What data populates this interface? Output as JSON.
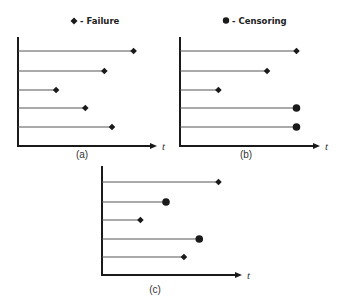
{
  "legend": {
    "failure": {
      "symbol": "diamond",
      "label": "- Failure"
    },
    "censoring": {
      "symbol": "circle",
      "label": "- Censoring"
    }
  },
  "axis_label": "t",
  "colors": {
    "ink": "#1a1a1a",
    "line": "#555555"
  },
  "panels": [
    {
      "id": "a",
      "label": "(a)",
      "subjects": [
        {
          "end": 0.91,
          "event": "failure"
        },
        {
          "end": 0.68,
          "event": "failure"
        },
        {
          "end": 0.3,
          "event": "failure"
        },
        {
          "end": 0.53,
          "event": "failure"
        },
        {
          "end": 0.74,
          "event": "failure"
        }
      ]
    },
    {
      "id": "b",
      "label": "(b)",
      "subjects": [
        {
          "end": 0.91,
          "event": "failure"
        },
        {
          "end": 0.68,
          "event": "failure"
        },
        {
          "end": 0.3,
          "event": "failure"
        },
        {
          "end": 0.91,
          "event": "censoring"
        },
        {
          "end": 0.91,
          "event": "censoring"
        }
      ]
    },
    {
      "id": "c",
      "label": "(c)",
      "subjects": [
        {
          "end": 0.91,
          "event": "failure"
        },
        {
          "end": 0.5,
          "event": "censoring"
        },
        {
          "end": 0.3,
          "event": "failure"
        },
        {
          "end": 0.76,
          "event": "censoring"
        },
        {
          "end": 0.64,
          "event": "failure"
        }
      ]
    }
  ]
}
